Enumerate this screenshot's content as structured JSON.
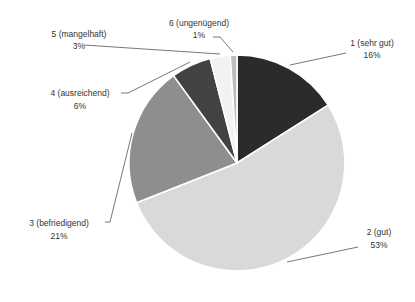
{
  "chart_data": {
    "type": "pie",
    "title": "",
    "categories": [
      "1 (sehr gut)",
      "2 (gut)",
      "3 (befriedigend)",
      "4 (ausreichend)",
      "5 (mangelhaft)",
      "6 (ungenügend)"
    ],
    "values": [
      16,
      53,
      21,
      6,
      3,
      1
    ],
    "value_labels": [
      "16%",
      "53%",
      "21%",
      "6%",
      "3%",
      "1%"
    ],
    "colors": [
      "#2b2b2b",
      "#d9d9d9",
      "#8e8e8e",
      "#424242",
      "#f2f2f2",
      "#bdbdbd"
    ],
    "start_angle_deg": 0,
    "direction": "clockwise",
    "legend": "none",
    "labels_outside_with_leader_lines": true
  },
  "labels": [
    {
      "name": "1 (sehr gut)",
      "pct": "16%"
    },
    {
      "name": "2 (gut)",
      "pct": "53%"
    },
    {
      "name": "3 (befriedigend)",
      "pct": "21%"
    },
    {
      "name": "4 (ausreichend)",
      "pct": "6%"
    },
    {
      "name": "5 (mangelhaft)",
      "pct": "3%"
    },
    {
      "name": "6 (ungenügend)",
      "pct": "1%"
    }
  ]
}
